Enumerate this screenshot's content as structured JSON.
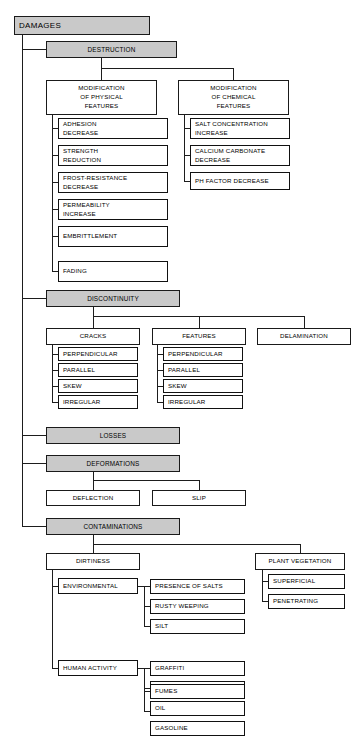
{
  "diagram": {
    "title": "DAMAGES",
    "root": {
      "label": "DAMAGES"
    },
    "categories": [
      {
        "label": "DESTRUCTION"
      },
      {
        "label": "DISCONTINUITY"
      },
      {
        "label": "LOSSES"
      },
      {
        "label": "DEFORMATIONS"
      },
      {
        "label": "CONTAMINATIONS"
      }
    ],
    "destruction": {
      "groups": [
        {
          "label": "MODIFICATION\nOF PHYSICAL\nFEATURES",
          "items": [
            {
              "label": "ADHESION\nDECREASE"
            },
            {
              "label": "STRENGTH\nREDUCTION"
            },
            {
              "label": "FROST-RESISTANCE\nDECREASE"
            },
            {
              "label": "PERMEABILITY\nINCREASE"
            },
            {
              "label": "EMBRITTLEMENT"
            },
            {
              "label": "FADING"
            }
          ]
        },
        {
          "label": "MODIFICATION\nOF CHEMICAL\nFEATURES",
          "items": [
            {
              "label": "SALT CONCENTRATION\nINCREASE"
            },
            {
              "label": "CALCIUM CARBONATE\nDECREASE"
            },
            {
              "label": "PH FACTOR DECREASE"
            }
          ]
        }
      ]
    },
    "discontinuity": {
      "groups": [
        {
          "label": "CRACKS",
          "items": [
            {
              "label": "PERPENDICULAR"
            },
            {
              "label": "PARALLEL"
            },
            {
              "label": "SKEW"
            },
            {
              "label": "IRREGULAR"
            }
          ]
        },
        {
          "label": "FEATURES",
          "items": [
            {
              "label": "PERPENDICULAR"
            },
            {
              "label": "PARALLEL"
            },
            {
              "label": "SKEW"
            },
            {
              "label": "IRREGULAR"
            }
          ]
        },
        {
          "label": "DELAMINATION",
          "items": []
        }
      ]
    },
    "deformations": {
      "items": [
        {
          "label": "DEFLECTION"
        },
        {
          "label": "SLIP"
        }
      ]
    },
    "contaminations": {
      "groups": [
        {
          "label": "DIRTINESS",
          "subgroups": [
            {
              "label": "ENVIRONMENTAL",
              "items": [
                {
                  "label": "PRESENCE OF SALTS"
                },
                {
                  "label": "RUSTY WEEPING"
                },
                {
                  "label": "SILT"
                }
              ]
            },
            {
              "label": "HUMAN ACTIVITY",
              "items": [
                {
                  "label": "GRAFFITI"
                },
                {
                  "label": "SOOT"
                },
                {
                  "label": "FUMES"
                },
                {
                  "label": "OIL"
                },
                {
                  "label": "GASOLINE"
                }
              ]
            }
          ]
        },
        {
          "label": "PLANT VEGETATION",
          "subgroups": [],
          "items": [
            {
              "label": "SUPERFICIAL"
            },
            {
              "label": "PENETRATING"
            }
          ]
        }
      ]
    },
    "colors": {
      "shaded_fill": "#c9c9c9",
      "box_fill": "#ffffff",
      "line": "#1d1d1d",
      "text": "#000000"
    }
  }
}
